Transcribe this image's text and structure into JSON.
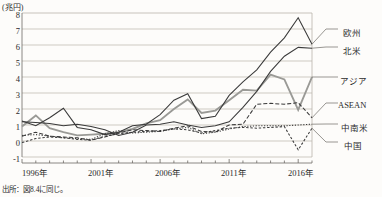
{
  "chart_data": {
    "type": "line",
    "title": "",
    "unit_label": "(兆円)",
    "xlabel": "",
    "ylabel": "兆円",
    "ylim": [
      -1,
      8
    ],
    "yticks": [
      "8",
      "7",
      "6",
      "5",
      "4",
      "3",
      "2",
      "1",
      "0",
      "-1"
    ],
    "grid": true,
    "legend_position": "right",
    "x": [
      1996,
      1997,
      1998,
      1999,
      2000,
      2001,
      2002,
      2003,
      2004,
      2005,
      2006,
      2007,
      2008,
      2009,
      2010,
      2011,
      2012,
      2013,
      2014,
      2015,
      2016,
      2017
    ],
    "xticks": [
      "1996年",
      "2001年",
      "2006年",
      "2011年",
      "2016年"
    ],
    "xtick_years": [
      1996,
      2001,
      2006,
      2011,
      2016
    ],
    "series": [
      {
        "name": "欧州",
        "style": "solid-dark",
        "color": "#3a3a3a",
        "values": [
          1.25,
          0.95,
          1.45,
          2.05,
          0.85,
          0.7,
          0.4,
          0.55,
          0.95,
          1.05,
          1.65,
          2.55,
          2.95,
          1.4,
          1.55,
          2.85,
          3.7,
          4.45,
          5.55,
          6.45,
          7.7,
          6.05
        ]
      },
      {
        "name": "北米",
        "style": "solid-dark",
        "color": "#3a3a3a",
        "values": [
          1.2,
          1.15,
          1.1,
          0.95,
          1.05,
          0.9,
          0.7,
          0.35,
          0.55,
          1.0,
          1.05,
          1.2,
          1.0,
          0.85,
          0.95,
          1.2,
          2.1,
          3.1,
          4.35,
          5.3,
          5.85,
          5.8
        ]
      },
      {
        "name": "アジア",
        "style": "solid-gray",
        "color": "#9a9a96",
        "values": [
          0.9,
          1.6,
          0.8,
          0.55,
          0.35,
          0.4,
          0.45,
          0.55,
          0.75,
          1.1,
          1.3,
          2.0,
          2.6,
          1.75,
          1.9,
          2.55,
          3.2,
          3.15,
          4.15,
          3.85,
          1.95,
          4.0
        ]
      },
      {
        "name": "ASEAN",
        "style": "dashed-long",
        "color": "#3a3a3a",
        "values": [
          0.3,
          0.55,
          0.3,
          0.25,
          0.2,
          0.05,
          0.25,
          0.5,
          0.7,
          0.65,
          0.6,
          0.8,
          0.95,
          0.6,
          0.55,
          1.0,
          1.05,
          2.3,
          2.35,
          2.3,
          2.4,
          1.45
        ]
      },
      {
        "name": "中南米",
        "style": "dashed-dot",
        "color": "#3a3a3a",
        "values": [
          0.35,
          0.4,
          0.3,
          0.2,
          0.15,
          0.1,
          0.45,
          0.65,
          0.5,
          0.55,
          0.6,
          0.75,
          0.85,
          0.45,
          0.55,
          0.75,
          0.9,
          0.95,
          0.95,
          0.95,
          1.0,
          1.05
        ]
      },
      {
        "name": "中国",
        "style": "dashed-short",
        "color": "#3a3a3a",
        "values": [
          -0.1,
          0.15,
          0.25,
          0.2,
          0.1,
          0.05,
          0.3,
          0.45,
          0.55,
          0.6,
          0.65,
          0.75,
          0.7,
          0.5,
          0.65,
          0.8,
          0.85,
          0.8,
          0.85,
          0.9,
          -0.55,
          0.8
        ]
      }
    ],
    "legend_entries": [
      {
        "label": "欧州"
      },
      {
        "label": "北米"
      },
      {
        "label": "アジア"
      },
      {
        "label": "ASEAN"
      },
      {
        "label": "中南米"
      },
      {
        "label": "中国"
      }
    ],
    "source_note": "出所：図8.4に同じ。"
  }
}
